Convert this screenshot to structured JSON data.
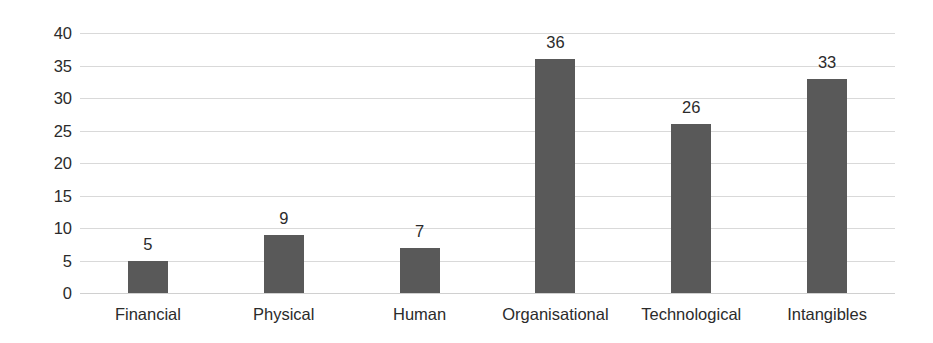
{
  "chart_data": {
    "type": "bar",
    "title": "",
    "subtitle": "",
    "xlabel": "",
    "ylabel": "",
    "categories": [
      "Financial",
      "Physical",
      "Human",
      "Organisational",
      "Technological",
      "Intangibles"
    ],
    "values": [
      5,
      9,
      7,
      36,
      26,
      33
    ],
    "data_labels": [
      "5",
      "9",
      "7",
      "36",
      "26",
      "33"
    ],
    "ylim": [
      0,
      40
    ],
    "ytick_step": 5,
    "ytick_labels": [
      "40",
      "35",
      "30",
      "25",
      "20",
      "15",
      "10",
      "5",
      "0"
    ],
    "ytick_values": [
      40,
      35,
      30,
      25,
      20,
      15,
      10,
      5,
      0
    ],
    "grid": true,
    "grid_axis": "y",
    "legend": false,
    "legend_position": "none",
    "bar_color": "#595959",
    "gridline_color": "#d9d9d9",
    "text_color": "#2b2b2b",
    "background_color": "#ffffff"
  }
}
